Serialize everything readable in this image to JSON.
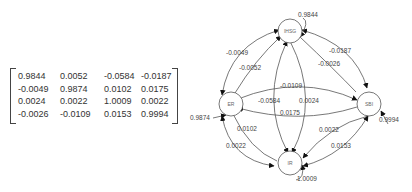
{
  "matrix": {
    "rows": [
      [
        "0.9844",
        "0.0052",
        "-0.0584",
        "-0.0187"
      ],
      [
        "-0.0049",
        "0.9874",
        "0.0102",
        "0.0175"
      ],
      [
        "0.0024",
        "0.0022",
        "1.0009",
        "0.0022"
      ],
      [
        "-0.0026",
        "-0.0109",
        "0.0153",
        "0.9994"
      ]
    ]
  },
  "graph": {
    "nodes": {
      "top": "IHSG",
      "left": "ER",
      "right": "SBI",
      "bottom": "IR"
    },
    "self_loops": {
      "top": "0.9844",
      "left": "0.9874",
      "right": "0.9994",
      "bottom": "1.0009"
    },
    "edges": {
      "left_top_outer": "-0.0049",
      "left_top_inner": "-0.0052",
      "top_right_outer": "-0.0187",
      "top_right_inner": "-0.0026",
      "left_right_upper": "-0.0109",
      "left_right_lower": "0.0175",
      "top_bottom_left": "-0.0584",
      "top_bottom_right": "0.0024",
      "left_bottom_inner": "0.0102",
      "left_bottom_outer": "0.0022",
      "right_bottom_inner": "0.0022",
      "right_bottom_outer": "0.0153"
    },
    "colors": {
      "line": "#555555",
      "arrow": "#111111",
      "node_border": "#555555"
    }
  }
}
